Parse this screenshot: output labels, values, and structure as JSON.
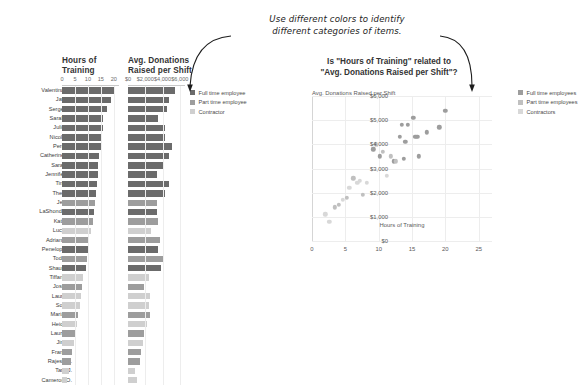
{
  "annotation": {
    "line1": "Use different colors to identify",
    "line2": "different categories of items."
  },
  "colors": {
    "full_time": "#6b6b6b",
    "part_time": "#9d9d9d",
    "contractor": "#cfcfcf",
    "grid": "#ededed",
    "axis": "#c9c9c9",
    "text": "#4a4a4a"
  },
  "bar_panel": {
    "columns": [
      {
        "title_line1": "Hours of",
        "title_line2": "Training",
        "ticks": [
          "0",
          "5",
          "10",
          "15",
          "20"
        ],
        "max": 22
      },
      {
        "title_line1": "Avg. Donations",
        "title_line2": "Raised per Shift",
        "ticks": [
          "$0",
          "$2,000",
          "$4,000",
          "$6,000"
        ],
        "max": 6600
      }
    ],
    "legend": [
      {
        "label": "Full time employee",
        "color": "#6b6b6b"
      },
      {
        "label": "Part time employee",
        "color": "#9d9d9d"
      },
      {
        "label": "Contractor",
        "color": "#cfcfcf"
      }
    ],
    "rows": [
      {
        "name": "Valentina M.",
        "category": "Full time employee",
        "hours": 20.0,
        "donations": 5400
      },
      {
        "name": "Javi L.",
        "category": "Full time employee",
        "hours": 19.1,
        "donations": 4700
      },
      {
        "name": "Sergei R.",
        "category": "Full time employee",
        "hours": 17.2,
        "donations": 4500
      },
      {
        "name": "Sarah Q.",
        "category": "Full time employee",
        "hours": 16.0,
        "donations": 3500
      },
      {
        "name": "Julie R.",
        "category": "Full time employee",
        "hours": 15.8,
        "donations": 4300
      },
      {
        "name": "Nicole E.",
        "category": "Full time employee",
        "hours": 15.5,
        "donations": 4300
      },
      {
        "name": "Percy I.",
        "category": "Full time employee",
        "hours": 15.2,
        "donations": 5100
      },
      {
        "name": "Catherine M.",
        "category": "Full time employee",
        "hours": 14.4,
        "donations": 4800
      },
      {
        "name": "Sarah F.",
        "category": "Full time employee",
        "hours": 14.0,
        "donations": 4100
      },
      {
        "name": "Jennifer B.",
        "category": "Full time employee",
        "hours": 13.8,
        "donations": 3400
      },
      {
        "name": "Tina J.",
        "category": "Full time employee",
        "hours": 13.5,
        "donations": 4800
      },
      {
        "name": "Theo B.",
        "category": "Full time employee",
        "hours": 13.2,
        "donations": 4300
      },
      {
        "name": "Jeff L.",
        "category": "Part time employee",
        "hours": 12.6,
        "donations": 3300
      },
      {
        "name": "LaShonda R.",
        "category": "Full time employee",
        "hours": 12.3,
        "donations": 3300
      },
      {
        "name": "Kate B.",
        "category": "Part time employee",
        "hours": 11.8,
        "donations": 3500
      },
      {
        "name": "Lucy. L.",
        "category": "Contractor",
        "hours": 11.2,
        "donations": 2700
      },
      {
        "name": "Adriana E.",
        "category": "Part time employee",
        "hours": 10.6,
        "donations": 3700
      },
      {
        "name": "Penelope A.",
        "category": "Full time employee",
        "hours": 10.2,
        "donations": 3500
      },
      {
        "name": "Todd H.",
        "category": "Part time employee",
        "hours": 9.6,
        "donations": 4000
      },
      {
        "name": "Shaun R.",
        "category": "Full time employee",
        "hours": 9.2,
        "donations": 3800
      },
      {
        "name": "Tiffany P.",
        "category": "Contractor",
        "hours": 8.2,
        "donations": 2400
      },
      {
        "name": "Jose R.",
        "category": "Part time employee",
        "hours": 7.6,
        "donations": 1900
      },
      {
        "name": "Laura J.",
        "category": "Contractor",
        "hours": 7.2,
        "donations": 2500
      },
      {
        "name": "Son L.",
        "category": "Contractor",
        "hours": 6.8,
        "donations": 2400
      },
      {
        "name": "Maria G.",
        "category": "Part time employee",
        "hours": 6.2,
        "donations": 2600
      },
      {
        "name": "Heidi O.",
        "category": "Contractor",
        "hours": 5.6,
        "donations": 2200
      },
      {
        "name": "Laura K.",
        "category": "Part time employee",
        "hours": 5.2,
        "donations": 1800
      },
      {
        "name": "Jim B.",
        "category": "Contractor",
        "hours": 4.6,
        "donations": 1700
      },
      {
        "name": "Frank L.",
        "category": "Part time employee",
        "hours": 4.0,
        "donations": 1500
      },
      {
        "name": "Rajesh S.",
        "category": "Part time employee",
        "hours": 3.4,
        "donations": 1400
      },
      {
        "name": "Tara J.",
        "category": "Contractor",
        "hours": 2.6,
        "donations": 800
      },
      {
        "name": "Cameron O.",
        "category": "Contractor",
        "hours": 2.0,
        "donations": 1100
      }
    ]
  },
  "chart_data": {
    "type": "scatter",
    "title_line1": "Is \"Hours of Training\" related to",
    "title_line2": "\"Avg. Donations Raised per Shift\"?",
    "ylabel": "Avg. Donations Raised per Shift",
    "xlabel": "Hours of Training",
    "xlim": [
      0,
      27
    ],
    "ylim": [
      0,
      6000
    ],
    "xticks": [
      "0",
      "5",
      "10",
      "15",
      "20",
      "25"
    ],
    "xtick_values": [
      0,
      5,
      10,
      15,
      20,
      25
    ],
    "yticks": [
      "$0",
      "$1,000",
      "$2,000",
      "$3,000",
      "$4,000",
      "$5,000",
      "$6,000"
    ],
    "ytick_values": [
      0,
      1000,
      2000,
      3000,
      4000,
      5000,
      6000
    ],
    "grid": true,
    "legend_position": "right",
    "legend": [
      {
        "label": "Full time employees",
        "color": "#9d9d9d"
      },
      {
        "label": "Part time employees",
        "color": "#c0c0c0"
      },
      {
        "label": "Contractors",
        "color": "#d8d8d8"
      }
    ],
    "series": [
      {
        "name": "Full time employees",
        "color": "#9d9d9d",
        "points": [
          [
            20.0,
            5400
          ],
          [
            19.1,
            4700
          ],
          [
            17.2,
            4500
          ],
          [
            16.0,
            3500
          ],
          [
            15.8,
            4300
          ],
          [
            15.5,
            4300
          ],
          [
            15.2,
            5100
          ],
          [
            14.4,
            4800
          ],
          [
            14.0,
            4100
          ],
          [
            13.8,
            3400
          ],
          [
            13.5,
            4800
          ],
          [
            13.2,
            4300
          ],
          [
            12.3,
            3300
          ],
          [
            10.2,
            3500
          ],
          [
            9.2,
            3800
          ]
        ]
      },
      {
        "name": "Part time employees",
        "color": "#c0c0c0",
        "points": [
          [
            12.6,
            3300
          ],
          [
            11.8,
            3500
          ],
          [
            10.6,
            3700
          ],
          [
            9.6,
            4000
          ],
          [
            7.6,
            1900
          ],
          [
            6.2,
            2600
          ],
          [
            5.2,
            1800
          ],
          [
            4.0,
            1500
          ],
          [
            3.4,
            1400
          ]
        ]
      },
      {
        "name": "Contractors",
        "color": "#d8d8d8",
        "points": [
          [
            11.2,
            2700
          ],
          [
            8.2,
            2400
          ],
          [
            7.2,
            2500
          ],
          [
            6.8,
            2400
          ],
          [
            5.6,
            2200
          ],
          [
            4.6,
            1700
          ],
          [
            2.6,
            800
          ],
          [
            2.0,
            1100
          ]
        ]
      }
    ]
  }
}
